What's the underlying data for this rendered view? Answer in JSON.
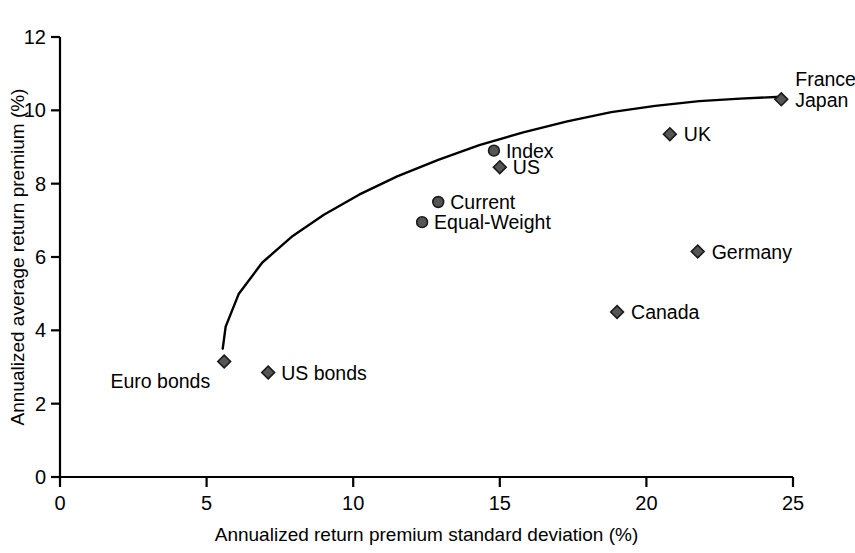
{
  "chart_data": {
    "type": "scatter",
    "title": "",
    "xlabel": "Annualized return premium standard deviation (%)",
    "ylabel": "Annualized average return premium (%)",
    "xlim": [
      0,
      25
    ],
    "ylim": [
      0,
      12
    ],
    "xticks": [
      0,
      5,
      10,
      15,
      20,
      25
    ],
    "yticks": [
      0,
      2,
      4,
      6,
      8,
      10,
      12
    ],
    "xtick_labels": [
      "0",
      "5",
      "10",
      "15",
      "20",
      "25"
    ],
    "ytick_labels": [
      "0",
      "2",
      "4",
      "6",
      "8",
      "10",
      "12"
    ],
    "grid": false,
    "legend": "none",
    "points": [
      {
        "label": "France",
        "x": 24.6,
        "y": 10.3,
        "marker": "diamond",
        "label_dx": 14,
        "label_dy": -13,
        "anchor": "start",
        "shared_marker": true
      },
      {
        "label": "Japan",
        "x": 24.6,
        "y": 10.3,
        "marker": "none",
        "label_dx": 14,
        "label_dy": 8,
        "anchor": "start",
        "shared_marker": true
      },
      {
        "label": "UK",
        "x": 20.8,
        "y": 9.35,
        "marker": "diamond",
        "label_dx": 14,
        "label_dy": 7,
        "anchor": "start"
      },
      {
        "label": "Index",
        "x": 14.8,
        "y": 8.9,
        "marker": "circle",
        "label_dx": 12,
        "label_dy": 7,
        "anchor": "start"
      },
      {
        "label": "US",
        "x": 15.0,
        "y": 8.45,
        "marker": "diamond",
        "label_dx": 13,
        "label_dy": 7,
        "anchor": "start"
      },
      {
        "label": "Current",
        "x": 12.9,
        "y": 7.5,
        "marker": "circle",
        "label_dx": 12,
        "label_dy": 7,
        "anchor": "start"
      },
      {
        "label": "Equal-Weight",
        "x": 12.35,
        "y": 6.95,
        "marker": "circle",
        "label_dx": 12,
        "label_dy": 7,
        "anchor": "start"
      },
      {
        "label": "Germany",
        "x": 21.75,
        "y": 6.15,
        "marker": "diamond",
        "label_dx": 14,
        "label_dy": 7,
        "anchor": "start"
      },
      {
        "label": "Canada",
        "x": 19.0,
        "y": 4.5,
        "marker": "diamond",
        "label_dx": 14,
        "label_dy": 7,
        "anchor": "start"
      },
      {
        "label": "Euro bonds",
        "x": 5.6,
        "y": 3.15,
        "marker": "diamond",
        "label_dx": -14,
        "label_dy": 26,
        "anchor": "end"
      },
      {
        "label": "US bonds",
        "x": 7.1,
        "y": 2.85,
        "marker": "diamond",
        "label_dx": 13,
        "label_dy": 7,
        "anchor": "start"
      }
    ],
    "frontier_curve": {
      "name": "efficient frontier",
      "x": [
        5.55,
        5.65,
        6.1,
        6.9,
        7.9,
        9.0,
        10.2,
        11.5,
        12.9,
        14.3,
        15.8,
        17.3,
        18.8,
        20.3,
        21.8,
        23.2,
        24.6
      ],
      "y": [
        3.5,
        4.1,
        5.0,
        5.85,
        6.55,
        7.15,
        7.7,
        8.2,
        8.65,
        9.05,
        9.4,
        9.7,
        9.95,
        10.12,
        10.25,
        10.32,
        10.37
      ]
    }
  },
  "style": {
    "marker_fill": "#555555",
    "marker_stroke": "#1a1a1a",
    "axis_color": "#000000",
    "curve_color": "#000000",
    "background": "#ffffff"
  }
}
